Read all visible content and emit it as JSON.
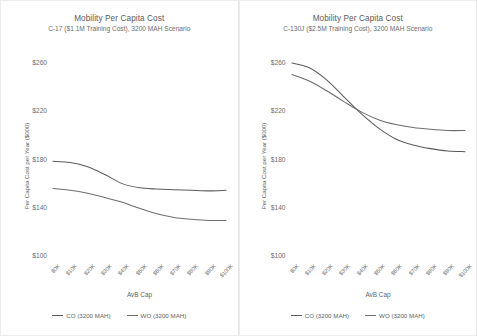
{
  "charts": [
    {
      "panel_name": "chart-panel-c17",
      "title": "Mobility Per Capita Cost",
      "subtitle": "C-17 ($1.1M Training Cost), 3200 MAH Scenario",
      "xlabel": "AvB Cap",
      "ylabel": "Per Capita Cost per Year ($000)",
      "legend": [
        {
          "label": "CO (3200 MAH)",
          "color": "#5c5c5c"
        },
        {
          "label": "WO (3200 MAH)",
          "color": "#6d6d6d"
        }
      ],
      "chart_data": {
        "type": "line",
        "title": "Mobility Per Capita Cost",
        "subtitle": "C-17 ($1.1M Training Cost), 3200 MAH Scenario",
        "xlabel": "AvB Cap",
        "ylabel": "Per Capita Cost per Year ($000)",
        "categories": [
          "$0K",
          "$10K",
          "$20K",
          "$30K",
          "$40K",
          "$50K",
          "$60K",
          "$70K",
          "$80K",
          "$90K",
          "$100K"
        ],
        "yticks": [
          "$100",
          "$140",
          "$180",
          "$220",
          "$260"
        ],
        "ylim": [
          100,
          260
        ],
        "grid": false,
        "legend_position": "bottom",
        "series": [
          {
            "name": "CO (3200 MAH)",
            "color": "#5c5c5c",
            "values": [
              178.5,
              177.5,
              174.0,
              167.5,
              160.0,
              156.5,
              155.5,
              155.0,
              154.5,
              154.0,
              154.5
            ]
          },
          {
            "name": "WO (3200 MAH)",
            "color": "#6d6d6d",
            "values": [
              156.0,
              154.5,
              152.0,
              148.5,
              144.5,
              139.5,
              135.0,
              132.0,
              130.5,
              129.5,
              129.5
            ]
          }
        ]
      }
    },
    {
      "panel_name": "chart-panel-c130j",
      "title": "Mobility Per Capita Cost",
      "subtitle": "C-130J ($2.5M Training Cost), 3200 MAH Scenario",
      "xlabel": "AvB Cap",
      "ylabel": "Per Capita Cost per Year ($000)",
      "legend": [
        {
          "label": "CO (3200 MAH)",
          "color": "#5c5c5c"
        },
        {
          "label": "WO (3200 MAH)",
          "color": "#6d6d6d"
        }
      ],
      "chart_data": {
        "type": "line",
        "title": "Mobility Per Capita Cost",
        "subtitle": "C-130J ($2.5M Training Cost), 3200 MAH Scenario",
        "xlabel": "AvB Cap",
        "ylabel": "Per Capita Cost per Year ($000)",
        "categories": [
          "$0K",
          "$10K",
          "$20K",
          "$30K",
          "$40K",
          "$50K",
          "$60K",
          "$70K",
          "$80K",
          "$90K",
          "$100K"
        ],
        "yticks": [
          "$100",
          "$140",
          "$180",
          "$220",
          "$260"
        ],
        "ylim": [
          100,
          260
        ],
        "grid": false,
        "legend_position": "bottom",
        "series": [
          {
            "name": "CO (3200 MAH)",
            "color": "#5c5c5c",
            "values": [
              260.0,
              256.0,
              246.0,
              232.0,
              218.0,
              206.0,
              197.0,
              192.0,
              189.0,
              187.0,
              186.5
            ]
          },
          {
            "name": "WO (3200 MAH)",
            "color": "#6d6d6d",
            "values": [
              250.5,
              245.0,
              237.0,
              228.0,
              219.5,
              213.0,
              209.0,
              206.5,
              205.0,
              204.0,
              204.0
            ]
          }
        ]
      }
    }
  ]
}
